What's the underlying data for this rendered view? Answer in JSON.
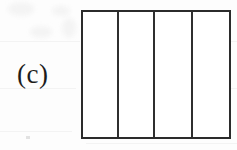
{
  "figure": {
    "panel_label": "(c)",
    "caption": "",
    "background_color": "#fdfdfd",
    "ink_color": "#2b2b2b",
    "fill_color": "#ffffff"
  },
  "diagram": {
    "type": "subdivided-rectangle",
    "outer": {
      "x": 81,
      "y": 10,
      "width": 150,
      "height": 129
    },
    "stroke_width": 2,
    "column_count": 4,
    "divider_count": 3,
    "divider_positions": [
      37,
      73,
      111
    ],
    "column_labels": [
      "",
      "",
      "",
      ""
    ]
  }
}
